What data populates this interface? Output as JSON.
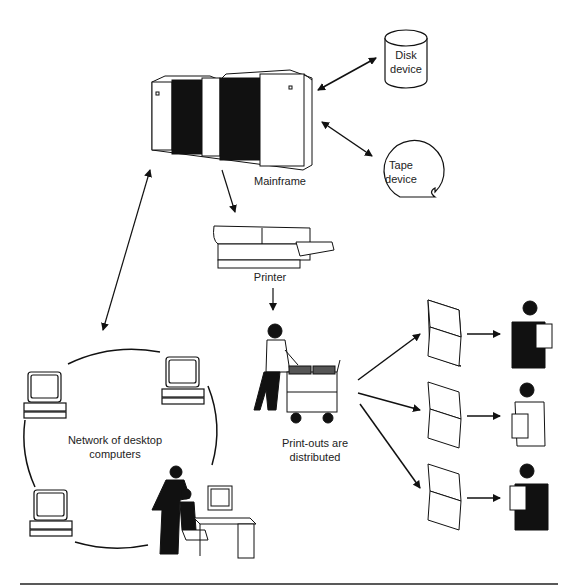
{
  "diagram": {
    "nodes": {
      "mainframe": {
        "label": "Mainframe"
      },
      "disk": {
        "label_line1": "Disk",
        "label_line2": "device"
      },
      "tape": {
        "label_line1": "Tape",
        "label_line2": "device"
      },
      "printer": {
        "label": "Printer"
      },
      "distribution": {
        "label_line1": "Print-outs are",
        "label_line2": "distributed"
      },
      "network": {
        "label_line1": "Network of desktop",
        "label_line2": "computers"
      }
    },
    "recipients_count": 3,
    "colors": {
      "ink": "#111111",
      "background": "#ffffff"
    }
  }
}
